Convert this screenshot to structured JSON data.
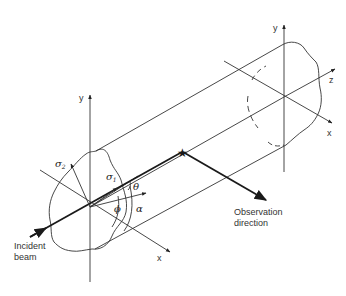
{
  "diagram": {
    "labels": {
      "incident_beam_line1": "Incident",
      "incident_beam_line2": "beam",
      "observation_line1": "Observation",
      "observation_line2": "direction"
    },
    "left_axes": {
      "y": "y",
      "x": "x"
    },
    "right_axes": {
      "y": "y",
      "z": "z",
      "x": "x"
    },
    "symbols": {
      "sigma1": "σ",
      "sigma1_sub": "1",
      "sigma2": "σ",
      "sigma2_sub": "2",
      "theta": "θ",
      "phi": "ϕ",
      "alpha": "α"
    },
    "colors": {
      "line": "#333333",
      "beam": "#1a1a1a",
      "background": "#ffffff"
    }
  }
}
